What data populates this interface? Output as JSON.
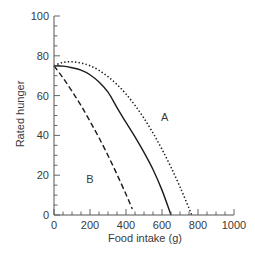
{
  "chart_data": {
    "type": "line",
    "title": "",
    "xlabel": "Food intake (g)",
    "ylabel": "Rated hunger",
    "xlim": [
      0,
      1000
    ],
    "ylim": [
      0,
      100
    ],
    "x_ticks": [
      0,
      200,
      400,
      600,
      800,
      1000
    ],
    "y_ticks": [
      0,
      20,
      40,
      60,
      80,
      100
    ],
    "x_minor_step": 50,
    "y_minor_step": 5,
    "grid": false,
    "legend": null,
    "annotations": [
      {
        "text": "A",
        "x": 615,
        "y": 49
      },
      {
        "text": "B",
        "x": 200,
        "y": 18
      }
    ],
    "series": [
      {
        "name": "A (dotted)",
        "style": "dotted",
        "color": "#1a1a1a",
        "points": [
          [
            0,
            75
          ],
          [
            50,
            76.7
          ],
          [
            100,
            77
          ],
          [
            150,
            76.4
          ],
          [
            200,
            75
          ],
          [
            250,
            72.7
          ],
          [
            300,
            69.5
          ],
          [
            350,
            65.6
          ],
          [
            400,
            60.8
          ],
          [
            450,
            55.1
          ],
          [
            500,
            48.6
          ],
          [
            550,
            41.2
          ],
          [
            600,
            33
          ],
          [
            650,
            24
          ],
          [
            700,
            14.1
          ],
          [
            750,
            3.4
          ],
          [
            765,
            0
          ]
        ]
      },
      {
        "name": "solid",
        "style": "solid",
        "color": "#1a1a1a",
        "points": [
          [
            0,
            75
          ],
          [
            50,
            74.8
          ],
          [
            100,
            74
          ],
          [
            150,
            72.8
          ],
          [
            200,
            70.5
          ],
          [
            250,
            66.8
          ],
          [
            300,
            61.7
          ],
          [
            350,
            54
          ],
          [
            400,
            46.5
          ],
          [
            450,
            39.3
          ],
          [
            500,
            31.5
          ],
          [
            550,
            22.9
          ],
          [
            600,
            12.5
          ],
          [
            650,
            0
          ]
        ]
      },
      {
        "name": "B (dashed)",
        "style": "dashed",
        "color": "#1a1a1a",
        "points": [
          [
            0,
            75
          ],
          [
            50,
            68.9
          ],
          [
            100,
            62.2
          ],
          [
            150,
            55
          ],
          [
            200,
            47.1
          ],
          [
            250,
            38.8
          ],
          [
            300,
            29.9
          ],
          [
            350,
            20.4
          ],
          [
            400,
            10.4
          ],
          [
            435,
            3
          ]
        ]
      }
    ]
  },
  "labels": {
    "xlabel": "Food intake (g)",
    "ylabel": "Rated hunger",
    "annotation_a": "A",
    "annotation_b": "B"
  }
}
